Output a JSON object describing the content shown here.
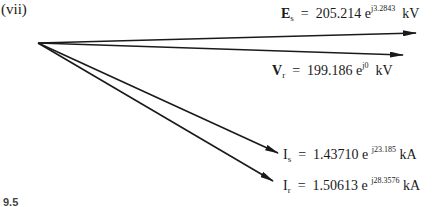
{
  "part_label": "(vii)",
  "figure_label": "9.5",
  "phasors": [
    {
      "symbol": "E",
      "subscript": "s",
      "magnitude": "205.214",
      "base": "e",
      "exponent": "j3.2843",
      "unit": "kV"
    },
    {
      "symbol": "V",
      "subscript": "r",
      "magnitude": "199.186",
      "base": "e",
      "exponent": "j0",
      "unit": "kV"
    },
    {
      "symbol": "I",
      "subscript": "s",
      "magnitude": "1.43710",
      "base": "e",
      "exponent": "j23.185",
      "unit": "kA"
    },
    {
      "symbol": "I",
      "subscript": "r",
      "magnitude": "1.50613",
      "base": "e",
      "exponent": "j28.3576",
      "unit": "kA"
    }
  ],
  "equals": "=",
  "colors": {
    "line": "#1a1a1a",
    "background": "#ffffff"
  }
}
